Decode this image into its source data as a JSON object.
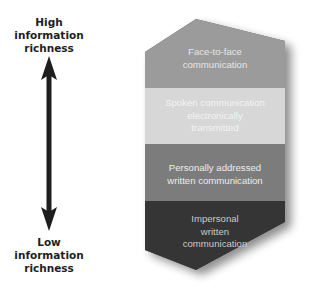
{
  "axis": {
    "top_label": "High information richness",
    "top_label_lines": [
      "High",
      "information",
      "richness"
    ],
    "bottom_label": "Low information richness",
    "bottom_label_lines": [
      "Low",
      "information",
      "richness"
    ],
    "arrow_icon": "double-headed-vertical-arrow",
    "arrow_color": "#1e1e1e"
  },
  "bands": [
    {
      "label": "Face-to-face communication",
      "lines": [
        "Face-to-face",
        "communication"
      ],
      "fill": "#9b9b9b",
      "text_color": "#e6e6e6"
    },
    {
      "label": "Spoken communication electronically transmitted",
      "lines": [
        "Spoken communication",
        "electronically",
        "transmitted"
      ],
      "fill": "#d7d7d7",
      "text_color": "#f2f2f2"
    },
    {
      "label": "Personally addressed written communication",
      "lines": [
        "Personally addressed",
        "written communication"
      ],
      "fill": "#7c7c7c",
      "text_color": "#ececec"
    },
    {
      "label": "Impersonal written communication",
      "lines": [
        "Impersonal",
        "written",
        "communication"
      ],
      "fill": "#353535",
      "text_color": "#c9c9c9"
    }
  ]
}
